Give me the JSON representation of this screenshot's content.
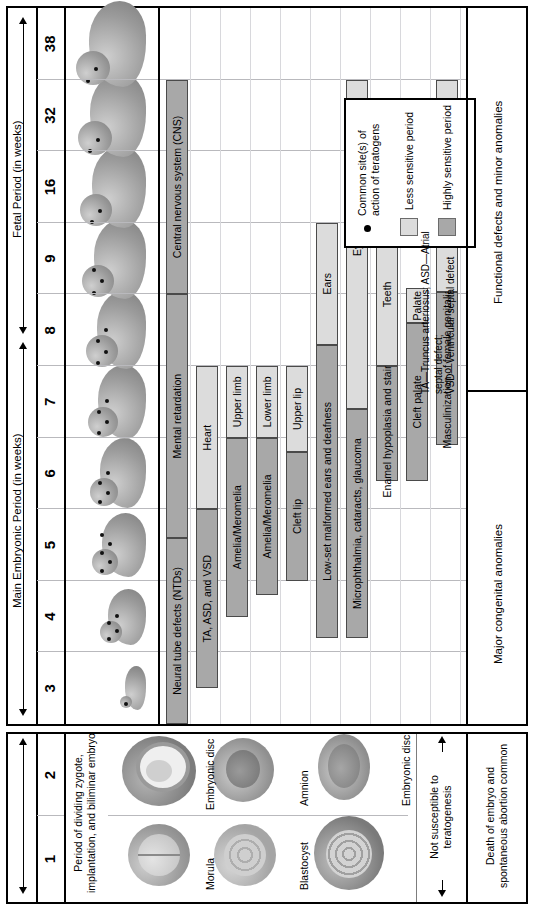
{
  "figure": {
    "type": "timeline-gantt",
    "title_periods": [
      {
        "id": "pre",
        "label": "",
        "weeks": [
          "1",
          "2"
        ]
      },
      {
        "id": "embryonic",
        "label": "Main Embryonic Period (in weeks)",
        "weeks": [
          "3",
          "4",
          "5",
          "6",
          "7",
          "8"
        ]
      },
      {
        "id": "fetal",
        "label": "Fetal Period (in weeks)",
        "weeks": [
          "9",
          "16",
          "32",
          "38"
        ]
      }
    ],
    "week_columns": [
      "1",
      "2",
      "3",
      "4",
      "5",
      "6",
      "7",
      "8",
      "9",
      "16",
      "32",
      "38"
    ]
  },
  "left_panel": {
    "stage_caption": "Period of dividing\nzygote, implantation,\nand biliminar embryo",
    "art_labels": [
      "Morula",
      "Blastocyst",
      "Amnion",
      "Embryonic disc",
      "Embryonic disc"
    ],
    "susceptibility_note": "Not susceptible to\nteratogenesis",
    "band_label": "Death of embryo and\nspontaneous abortion common"
  },
  "right_panel": {
    "band_label": "Major congenital anomalies",
    "band_label_fetal": "Functional defects and minor anomalies",
    "footnote": "TA—Truncus arteriosus; ASD—Atrial septal defect;\nVSD—Ventricular septal defect"
  },
  "legend": {
    "dot_label": "Common site(s) of action\nof teratogens",
    "less_label": "Less sensitive period",
    "high_label": "Highly sensitive period",
    "dot_color": "#000000",
    "less_color": "#dcdcdc",
    "high_color": "#a8a8a8"
  },
  "chart_data": {
    "type": "bar",
    "xlabel": "Weeks of gestation",
    "categories": [
      "1",
      "2",
      "3",
      "4",
      "5",
      "6",
      "7",
      "8",
      "9",
      "16",
      "32",
      "38"
    ],
    "rows": [
      {
        "organ": "Central nervous system (CNS)",
        "labels": [
          "Neural tube defects (NTDs)",
          "Mental retardation",
          "Central nervous system (CNS)"
        ],
        "segments": [
          {
            "kind": "high",
            "start_week": 3.0,
            "end_week": 5.6,
            "label": "Neural tube defects (NTDs)"
          },
          {
            "kind": "high",
            "start_week": 5.6,
            "end_week": 9.0,
            "label": "Mental retardation"
          },
          {
            "kind": "high",
            "start_week": 9.0,
            "end_week": 38.0,
            "label": "Central nervous system (CNS)"
          }
        ]
      },
      {
        "organ": "Heart",
        "segments": [
          {
            "kind": "high",
            "start_week": 3.5,
            "end_week": 6.0,
            "label": "TA, ASD, and VSD"
          },
          {
            "kind": "less",
            "start_week": 6.0,
            "end_week": 8.0,
            "label": "Heart"
          }
        ]
      },
      {
        "organ": "Upper limb",
        "segments": [
          {
            "kind": "high",
            "start_week": 4.5,
            "end_week": 7.0,
            "label": "Amelia/Meromelia"
          },
          {
            "kind": "less",
            "start_week": 7.0,
            "end_week": 8.0,
            "label": "Upper limb"
          }
        ]
      },
      {
        "organ": "Lower limb",
        "segments": [
          {
            "kind": "high",
            "start_week": 4.8,
            "end_week": 7.0,
            "label": "Amelia/Meromelia"
          },
          {
            "kind": "less",
            "start_week": 7.0,
            "end_week": 8.0,
            "label": "Lower limb"
          }
        ]
      },
      {
        "organ": "Upper lip",
        "segments": [
          {
            "kind": "high",
            "start_week": 5.0,
            "end_week": 6.8,
            "label": "Cleft lip"
          },
          {
            "kind": "less",
            "start_week": 6.8,
            "end_week": 8.0,
            "label": "Upper lip"
          }
        ]
      },
      {
        "organ": "Ears",
        "segments": [
          {
            "kind": "high",
            "start_week": 4.2,
            "end_week": 8.3,
            "label": "Low-set malformed ears and deafness"
          },
          {
            "kind": "less",
            "start_week": 8.3,
            "end_week": 16.0,
            "label": "Ears"
          }
        ]
      },
      {
        "organ": "Eyes",
        "segments": [
          {
            "kind": "high",
            "start_week": 4.2,
            "end_week": 7.4,
            "label": "Microphthalmia, cataracts, glaucoma"
          },
          {
            "kind": "less",
            "start_week": 7.4,
            "end_week": 38.0,
            "label": "Eyes"
          }
        ]
      },
      {
        "organ": "Teeth",
        "segments": [
          {
            "kind": "high",
            "start_week": 6.4,
            "end_week": 8.0,
            "label": "Enamel hypoplasia and staining"
          },
          {
            "kind": "less",
            "start_week": 8.0,
            "end_week": 16.0,
            "label": "Teeth"
          }
        ]
      },
      {
        "organ": "Palate",
        "segments": [
          {
            "kind": "high",
            "start_week": 6.4,
            "end_week": 8.6,
            "label": "Cleft palate"
          },
          {
            "kind": "less",
            "start_week": 8.6,
            "end_week": 9.6,
            "label": "Palate"
          }
        ]
      },
      {
        "organ": "External genitalia",
        "segments": [
          {
            "kind": "high",
            "start_week": 6.9,
            "end_week": 9.2,
            "label": "Masculinization of female genitalia"
          },
          {
            "kind": "less",
            "start_week": 9.2,
            "end_week": 38.0,
            "label": "External genitalia"
          }
        ]
      }
    ],
    "bands": [
      {
        "label": "Death of embryo and spontaneous abortion common",
        "start_week": 1,
        "end_week": 2.9
      },
      {
        "label": "Major congenital anomalies",
        "start_week": 3,
        "end_week": 8.6
      },
      {
        "label": "Functional defects and minor anomalies",
        "start_week": 8.6,
        "end_week": 38
      }
    ]
  }
}
